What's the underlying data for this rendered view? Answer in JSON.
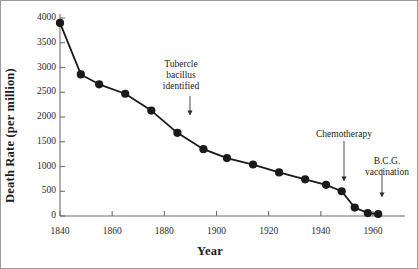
{
  "chart_data": {
    "type": "line",
    "title": "",
    "xlabel": "Year",
    "ylabel": "Death Rate (per million)",
    "xlim": [
      1838,
      1966
    ],
    "ylim": [
      0,
      4000
    ],
    "grid": false,
    "legend": "none",
    "marker": "filled-circle",
    "x_ticks": [
      1840,
      1860,
      1880,
      1900,
      1920,
      1940,
      1960
    ],
    "y_ticks": [
      0,
      500,
      1000,
      1500,
      2000,
      2500,
      3000,
      3500,
      4000
    ],
    "x_tick_labels": [
      "1840",
      "1860",
      "1880",
      "1900",
      "1920",
      "1940",
      "1960"
    ],
    "y_tick_labels": [
      "0",
      "500",
      "1000",
      "1500",
      "2000",
      "2500",
      "3000",
      "3500",
      "4000"
    ],
    "series": [
      {
        "name": "Tuberculosis death rate",
        "x": [
          1840,
          1848,
          1855,
          1865,
          1875,
          1885,
          1895,
          1904,
          1914,
          1924,
          1934,
          1942,
          1948,
          1953,
          1958,
          1962
        ],
        "values": [
          3900,
          2860,
          2660,
          2470,
          2130,
          1680,
          1350,
          1170,
          1040,
          880,
          740,
          630,
          500,
          170,
          60,
          40
        ]
      }
    ],
    "annotations": [
      {
        "text": "Tubercle bacillus identified",
        "lines": [
          "Tubercle",
          "bacillus",
          "identified"
        ],
        "x": 1885,
        "arrow": true
      },
      {
        "text": "Chemotherapy",
        "lines": [
          "Chemotherapy"
        ],
        "x": 1946,
        "arrow": true
      },
      {
        "text": "B.C.G. vaccination",
        "lines": [
          "B.C.G.",
          "vaccination"
        ],
        "x": 1954,
        "arrow": true
      }
    ],
    "colors": {
      "line": "#1a1a1a",
      "marker": "#1a1a1a",
      "axis": "#6e6e6e",
      "text": "#1a1a1a"
    }
  }
}
